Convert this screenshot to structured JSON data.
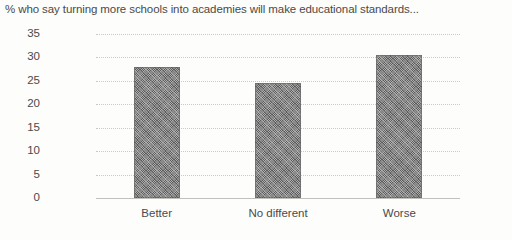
{
  "chart_data": {
    "type": "bar",
    "title": "% who say turning more schools into academies will make educational standards...",
    "categories": [
      "Better",
      "No different",
      "Worse"
    ],
    "values": [
      28,
      24.5,
      30.5
    ],
    "xlabel": "",
    "ylabel": "",
    "ylim": [
      0,
      35
    ],
    "yticks": [
      "0",
      "5",
      "10",
      "15",
      "20",
      "25",
      "30",
      "35"
    ],
    "ytick_values": [
      0,
      5,
      10,
      15,
      20,
      25,
      30,
      35
    ],
    "grid": true,
    "legend": false,
    "series": [
      {
        "name": "% of respondents",
        "values": [
          28,
          24.5,
          30.5
        ]
      }
    ],
    "bar_color": "#6e6e6e",
    "gridline_color": "#c8c8c6",
    "background_color": "#fdfdfc",
    "text_color": "#4a4a4a"
  }
}
